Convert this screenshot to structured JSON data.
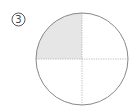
{
  "problem": {
    "number": "3",
    "label_glyph": "③"
  },
  "diagram": {
    "shape": "circle",
    "divisions": 4,
    "shaded_parts": 1,
    "shaded_quadrant": "top-left",
    "fraction_shaded": "1/4",
    "colors": {
      "outline": "#888888",
      "shade": "#e6e6e6",
      "divider": "#aaaaaa"
    }
  }
}
